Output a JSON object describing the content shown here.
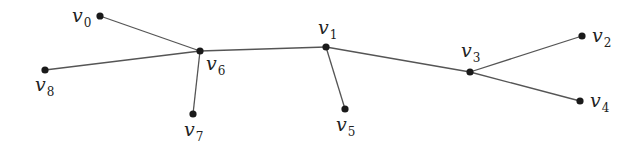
{
  "diagram": {
    "type": "tree-graph",
    "nodes": [
      {
        "id": "v0",
        "name": "v",
        "sub": "0",
        "x": 100,
        "y": 16,
        "lx": 72,
        "ly": 22
      },
      {
        "id": "v1",
        "name": "v",
        "sub": "1",
        "x": 326,
        "y": 47,
        "lx": 318,
        "ly": 34
      },
      {
        "id": "v2",
        "name": "v",
        "sub": "2",
        "x": 582,
        "y": 36,
        "lx": 592,
        "ly": 42
      },
      {
        "id": "v3",
        "name": "v",
        "sub": "3",
        "x": 470,
        "y": 72,
        "lx": 461,
        "ly": 57
      },
      {
        "id": "v4",
        "name": "v",
        "sub": "4",
        "x": 580,
        "y": 101,
        "lx": 590,
        "ly": 107
      },
      {
        "id": "v5",
        "name": "v",
        "sub": "5",
        "x": 345,
        "y": 109,
        "lx": 336,
        "ly": 131
      },
      {
        "id": "v6",
        "name": "v",
        "sub": "6",
        "x": 200,
        "y": 51,
        "lx": 206,
        "ly": 70
      },
      {
        "id": "v7",
        "name": "v",
        "sub": "7",
        "x": 193,
        "y": 114,
        "lx": 184,
        "ly": 136
      },
      {
        "id": "v8",
        "name": "v",
        "sub": "8",
        "x": 45,
        "y": 70,
        "lx": 35,
        "ly": 91
      }
    ],
    "edges": [
      [
        "v0",
        "v6"
      ],
      [
        "v8",
        "v6"
      ],
      [
        "v7",
        "v6"
      ],
      [
        "v6",
        "v1"
      ],
      [
        "v1",
        "v5"
      ],
      [
        "v1",
        "v3"
      ],
      [
        "v3",
        "v2"
      ],
      [
        "v3",
        "v4"
      ]
    ]
  }
}
